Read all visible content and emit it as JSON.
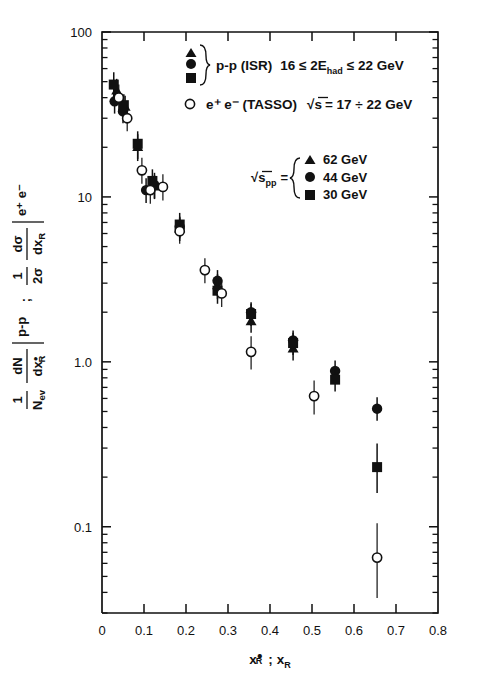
{
  "figure": {
    "axis_color": "#111111",
    "background": "#ffffff"
  },
  "chart_data": {
    "type": "scatter",
    "title": "",
    "xlabel": "x*R ; xR",
    "ylabel": "1/Nev dN/dx*R |p-p ; 1/(2σ) dσ/dxR |e+e-",
    "xscale": "linear",
    "yscale": "log",
    "xlim": [
      0,
      0.8
    ],
    "ylim": [
      0.03,
      100
    ],
    "grid": false,
    "xticks": [
      "0",
      "0.1",
      "0.2",
      "0.3",
      "0.4",
      "0.5",
      "0.6",
      "0.7",
      "0.8"
    ],
    "xtick_values": [
      0,
      0.1,
      0.2,
      0.3,
      0.4,
      0.5,
      0.6,
      0.7,
      0.8
    ],
    "yticks": [
      "100",
      "10",
      "1.0",
      "0.1"
    ],
    "ytick_values": [
      100,
      10,
      1.0,
      0.1
    ],
    "legend_position": "upper-right",
    "series": [
      {
        "name": "62 GeV",
        "label": "62 GeV",
        "marker": "triangle",
        "fill": "filled",
        "points": [
          {
            "x": 0.035,
            "y": 44,
            "yerr_lo": 7,
            "yerr_hi": 8
          },
          {
            "x": 0.055,
            "y": 35,
            "yerr_lo": 5,
            "yerr_hi": 6
          },
          {
            "x": 0.085,
            "y": 20,
            "yerr_lo": 3.5,
            "yerr_hi": 4
          },
          {
            "x": 0.125,
            "y": 11.5,
            "yerr_lo": 1.8,
            "yerr_hi": 2.0
          },
          {
            "x": 0.185,
            "y": 6.4,
            "yerr_lo": 1.0,
            "yerr_hi": 1.1
          },
          {
            "x": 0.275,
            "y": 2.9,
            "yerr_lo": 0.5,
            "yerr_hi": 0.5
          },
          {
            "x": 0.355,
            "y": 1.75,
            "yerr_lo": 0.25,
            "yerr_hi": 0.25
          },
          {
            "x": 0.455,
            "y": 1.2,
            "yerr_lo": 0.18,
            "yerr_hi": 0.18
          }
        ]
      },
      {
        "name": "44 GeV",
        "label": "44 GeV",
        "marker": "circle",
        "fill": "filled",
        "points": [
          {
            "x": 0.03,
            "y": 38,
            "yerr_lo": 6,
            "yerr_hi": 7
          },
          {
            "x": 0.05,
            "y": 33,
            "yerr_lo": 5,
            "yerr_hi": 5
          },
          {
            "x": 0.105,
            "y": 11.0,
            "yerr_lo": 1.8,
            "yerr_hi": 2.0
          },
          {
            "x": 0.125,
            "y": 11.8,
            "yerr_lo": 2.0,
            "yerr_hi": 2.2
          },
          {
            "x": 0.185,
            "y": 6.6,
            "yerr_lo": 1.0,
            "yerr_hi": 1.0
          },
          {
            "x": 0.275,
            "y": 3.1,
            "yerr_lo": 0.45,
            "yerr_hi": 0.5
          },
          {
            "x": 0.355,
            "y": 2.0,
            "yerr_lo": 0.3,
            "yerr_hi": 0.3
          },
          {
            "x": 0.455,
            "y": 1.35,
            "yerr_lo": 0.2,
            "yerr_hi": 0.2
          },
          {
            "x": 0.555,
            "y": 0.88,
            "yerr_lo": 0.13,
            "yerr_hi": 0.14
          },
          {
            "x": 0.655,
            "y": 0.52,
            "yerr_lo": 0.08,
            "yerr_hi": 0.09
          }
        ]
      },
      {
        "name": "30 GeV",
        "label": "30 GeV",
        "marker": "square",
        "fill": "filled",
        "points": [
          {
            "x": 0.028,
            "y": 48,
            "yerr_lo": 8,
            "yerr_hi": 9
          },
          {
            "x": 0.052,
            "y": 36,
            "yerr_lo": 6,
            "yerr_hi": 6
          },
          {
            "x": 0.085,
            "y": 21,
            "yerr_lo": 4,
            "yerr_hi": 4
          },
          {
            "x": 0.12,
            "y": 12.5,
            "yerr_lo": 2.0,
            "yerr_hi": 2.2
          },
          {
            "x": 0.185,
            "y": 6.8,
            "yerr_lo": 1.1,
            "yerr_hi": 1.2
          },
          {
            "x": 0.275,
            "y": 2.7,
            "yerr_lo": 0.45,
            "yerr_hi": 0.45
          },
          {
            "x": 0.355,
            "y": 1.95,
            "yerr_lo": 0.3,
            "yerr_hi": 0.3
          },
          {
            "x": 0.455,
            "y": 1.3,
            "yerr_lo": 0.2,
            "yerr_hi": 0.2
          },
          {
            "x": 0.555,
            "y": 0.78,
            "yerr_lo": 0.12,
            "yerr_hi": 0.12
          },
          {
            "x": 0.655,
            "y": 0.23,
            "yerr_lo": 0.07,
            "yerr_hi": 0.09
          }
        ]
      },
      {
        "name": "TASSO",
        "label": "e+ e- (TASSO)",
        "marker": "circle",
        "fill": "open",
        "points": [
          {
            "x": 0.04,
            "y": 40,
            "yerr_lo": 7,
            "yerr_hi": 8
          },
          {
            "x": 0.06,
            "y": 30,
            "yerr_lo": 5,
            "yerr_hi": 6
          },
          {
            "x": 0.095,
            "y": 14.5,
            "yerr_lo": 2.5,
            "yerr_hi": 2.8
          },
          {
            "x": 0.115,
            "y": 11.0,
            "yerr_lo": 1.9,
            "yerr_hi": 2.0
          },
          {
            "x": 0.145,
            "y": 11.5,
            "yerr_lo": 2.0,
            "yerr_hi": 2.2
          },
          {
            "x": 0.185,
            "y": 6.2,
            "yerr_lo": 1.0,
            "yerr_hi": 1.1
          },
          {
            "x": 0.245,
            "y": 3.6,
            "yerr_lo": 0.6,
            "yerr_hi": 0.65
          },
          {
            "x": 0.285,
            "y": 2.6,
            "yerr_lo": 0.45,
            "yerr_hi": 0.5
          },
          {
            "x": 0.355,
            "y": 1.15,
            "yerr_lo": 0.25,
            "yerr_hi": 0.28
          },
          {
            "x": 0.505,
            "y": 0.62,
            "yerr_lo": 0.14,
            "yerr_hi": 0.15
          },
          {
            "x": 0.655,
            "y": 0.065,
            "yerr_lo": 0.028,
            "yerr_hi": 0.04
          }
        ]
      }
    ]
  },
  "legend": {
    "block1": {
      "markers": [
        "triangle",
        "circle",
        "square"
      ],
      "text_main": "p-p (ISR)",
      "text_cond_pre": "16 ≤ 2E",
      "text_cond_sub": "had",
      "text_cond_post": "≤ 22 GeV"
    },
    "block2": {
      "marker": "open-circle",
      "text": "e⁺ e⁻  (TASSO)",
      "energy_pre": "√s",
      "energy_post": "= 17 ÷ 22 GeV"
    },
    "block3": {
      "label_pre": "√s",
      "label_sub": "pp",
      "label_eq": "=",
      "entries": [
        {
          "marker": "triangle",
          "label": "62 GeV"
        },
        {
          "marker": "circle",
          "label": "44 GeV"
        },
        {
          "marker": "square",
          "label": "30 GeV"
        }
      ]
    }
  },
  "axes": {
    "x_title_1": "x",
    "x_title_1_sub": "R",
    "x_title_sep": ";",
    "x_title_2": "x",
    "x_title_2_sub": "R",
    "y_num_1": "1",
    "y_den_1": "N",
    "y_den_1_sub": "ev",
    "y_num_2": "dN",
    "y_den_2": "dx",
    "y_den_2_sub": "R",
    "y_bar_1": "p-p",
    "y_sep": ";",
    "y_num_3": "1",
    "y_den_3": "2σ",
    "y_num_4": "dσ",
    "y_den_4": "dx",
    "y_den_4_sub": "R",
    "y_bar_2": "e⁺ e⁻"
  }
}
